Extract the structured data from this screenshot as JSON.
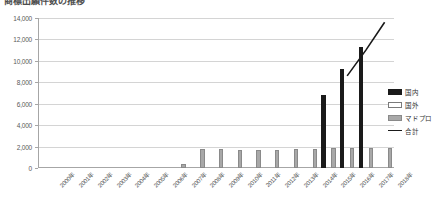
{
  "chart_data": {
    "type": "bar",
    "title": "商標出願件数の推移",
    "xlabel": "",
    "ylabel": "",
    "ylim": [
      0,
      14000
    ],
    "ytick_step": 2000,
    "ytick_labels": [
      "0",
      "2,000",
      "4,000",
      "6,000",
      "8,000",
      "10,000",
      "12,000",
      "14,000"
    ],
    "grid": true,
    "legend_position": "right",
    "categories": [
      "2000年",
      "2001年",
      "2002年",
      "2003年",
      "2004年",
      "2005年",
      "2006年",
      "2007年",
      "2008年",
      "2009年",
      "2010年",
      "2011年",
      "2012年",
      "2013年",
      "2014年",
      "2015年",
      "2016年",
      "2017年",
      "2018年"
    ],
    "series": [
      {
        "name": "国内",
        "color": "#1a1a1a",
        "type": "bar",
        "values": [
          0,
          0,
          0,
          0,
          0,
          0,
          0,
          0,
          0,
          0,
          0,
          0,
          0,
          0,
          0,
          6800,
          9200,
          11300,
          0
        ]
      },
      {
        "name": "国外",
        "color": "#ffffff",
        "type": "bar",
        "values": [
          0,
          0,
          0,
          0,
          0,
          0,
          0,
          0,
          0,
          0,
          0,
          0,
          0,
          0,
          0,
          0,
          0,
          0,
          0
        ]
      },
      {
        "name": "マドプロ",
        "color": "#a8a8a8",
        "type": "bar",
        "values": [
          0,
          0,
          0,
          0,
          0,
          0,
          0,
          350,
          1750,
          1780,
          1700,
          1700,
          1720,
          1750,
          1800,
          1850,
          1900,
          1880,
          1850
        ]
      },
      {
        "name": "合計",
        "color": "#1a1a1a",
        "type": "line",
        "values": [
          null,
          null,
          null,
          null,
          null,
          null,
          null,
          null,
          null,
          null,
          null,
          null,
          null,
          null,
          null,
          null,
          8600,
          11000,
          13600
        ]
      }
    ]
  },
  "legend": {
    "items": [
      {
        "label": "国内",
        "key": "kokunai"
      },
      {
        "label": "国外",
        "key": "kokugai"
      },
      {
        "label": "マドプロ",
        "key": "madopro"
      },
      {
        "label": "合計",
        "key": "goukei"
      }
    ]
  }
}
